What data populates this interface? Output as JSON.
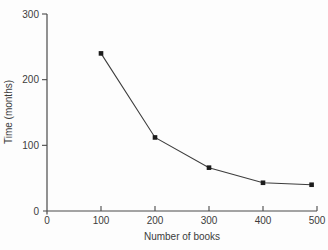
{
  "chart_data": {
    "type": "line",
    "title": "",
    "xlabel": "Number of books",
    "ylabel": "Time (months)",
    "x": [
      100,
      200,
      300,
      400,
      490
    ],
    "series": [
      {
        "name": "time-to-read",
        "values": [
          240,
          112,
          66,
          43,
          40
        ]
      }
    ],
    "xlim": [
      0,
      500
    ],
    "ylim": [
      0,
      300
    ],
    "x_ticks": [
      0,
      100,
      200,
      300,
      400,
      500
    ],
    "y_ticks": [
      0,
      100,
      200,
      300
    ],
    "grid": false,
    "legend": "none",
    "marker": "square",
    "colors": {
      "line": "#3d3d3d",
      "marker": "#1c1c1c",
      "axis": "#4a4a4a",
      "text": "#3c3c3c",
      "background": "#fdfdfd"
    }
  }
}
